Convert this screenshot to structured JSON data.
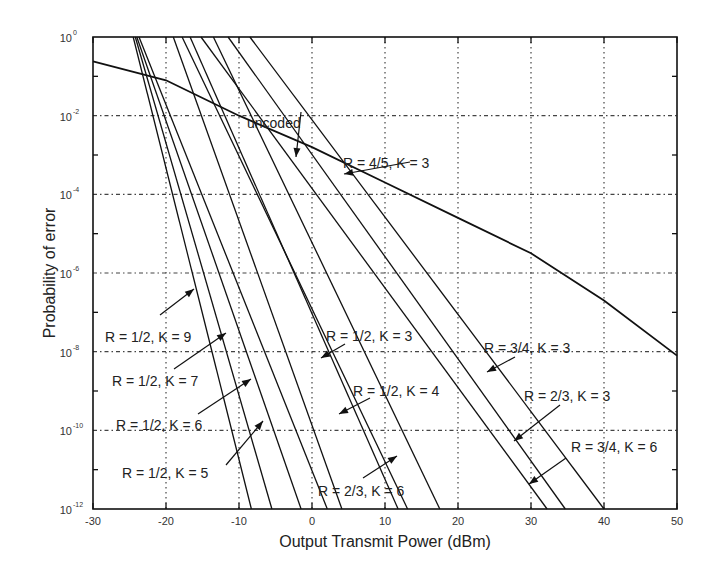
{
  "chart_data": {
    "type": "line",
    "title": "",
    "xlabel": "Output Transmit Power (dBm)",
    "ylabel": "Probability of error",
    "xlim": [
      -30,
      50
    ],
    "ylim_log10": [
      -12,
      0
    ],
    "yscale": "log",
    "grid": true,
    "x_ticks": [
      -30,
      -20,
      -10,
      0,
      10,
      20,
      30,
      40,
      50
    ],
    "y_ticks_exp": [
      0,
      -2,
      -4,
      -6,
      -8,
      -10,
      -12
    ],
    "series": [
      {
        "name": "uncoded",
        "points": [
          [
            -30,
            -0.62
          ],
          [
            -20,
            -1.1
          ],
          [
            -10,
            -2.0
          ],
          [
            0,
            -2.8
          ],
          [
            10,
            -3.7
          ],
          [
            20,
            -4.6
          ],
          [
            30,
            -5.5
          ],
          [
            40,
            -6.7
          ],
          [
            50,
            -8.1
          ]
        ]
      },
      {
        "name": "R = 1/2, K = 9",
        "points": [
          [
            -24.5,
            0
          ],
          [
            -8.3,
            -12
          ]
        ]
      },
      {
        "name": "R = 1/2, K = 7",
        "points": [
          [
            -24.2,
            0
          ],
          [
            -5.5,
            -12
          ]
        ]
      },
      {
        "name": "R = 1/2, K = 6",
        "points": [
          [
            -24.0,
            0
          ],
          [
            -1.5,
            -12
          ]
        ]
      },
      {
        "name": "R = 1/2, K = 5",
        "points": [
          [
            -23.7,
            0
          ],
          [
            2.1,
            -12
          ]
        ]
      },
      {
        "name": "R = 1/2, K = 4",
        "points": [
          [
            -19.0,
            0
          ],
          [
            4.1,
            -12
          ]
        ]
      },
      {
        "name": "R = 1/2, K = 3",
        "points": [
          [
            -17.8,
            0
          ],
          [
            13.1,
            -12
          ]
        ]
      },
      {
        "name": "R = 2/3, K = 6",
        "points": [
          [
            -16.7,
            0
          ],
          [
            11.8,
            -12
          ]
        ]
      },
      {
        "name": "R = 2/3, K = 3",
        "points": [
          [
            -15.2,
            0
          ],
          [
            32.2,
            -12
          ]
        ]
      },
      {
        "name": "R = 3/4, K = 6",
        "points": [
          [
            -13.5,
            0
          ],
          [
            17.5,
            -12
          ]
        ]
      },
      {
        "name": "R = 3/4, K = 3",
        "points": [
          [
            -11.5,
            0
          ],
          [
            34.7,
            -12
          ]
        ]
      },
      {
        "name": "R = 4/5, K = 3",
        "points": [
          [
            -8.5,
            0
          ],
          [
            40.0,
            -12
          ]
        ]
      }
    ],
    "annotations": [
      {
        "text": "uncoded",
        "x": 247,
        "y": 128
      },
      {
        "text": "R = 4/5, K = 3",
        "x": 343,
        "y": 168
      },
      {
        "text": "R = 1/2, K = 9",
        "x": 105,
        "y": 342
      },
      {
        "text": "R = 1/2, K = 7",
        "x": 112,
        "y": 386
      },
      {
        "text": "R = 1/2, K = 6",
        "x": 116,
        "y": 430
      },
      {
        "text": "R = 1/2, K = 5",
        "x": 122,
        "y": 478
      },
      {
        "text": "R = 1/2, K = 3",
        "x": 326,
        "y": 341
      },
      {
        "text": "R = 1/2, K = 4",
        "x": 353,
        "y": 396
      },
      {
        "text": "R = 2/3, K = 6",
        "x": 318,
        "y": 496
      },
      {
        "text": "R = 3/4, K = 3",
        "x": 484,
        "y": 353
      },
      {
        "text": "R = 2/3, K = 3",
        "x": 524,
        "y": 401
      },
      {
        "text": "R = 3/4, K = 6",
        "x": 571,
        "y": 452
      }
    ]
  },
  "labels": {
    "xlabel": "Output Transmit Power (dBm)",
    "ylabel": "Probability of error",
    "xticks": [
      "-30",
      "-20",
      "-10",
      "0",
      "10",
      "20",
      "30",
      "40",
      "50"
    ],
    "yticks_base": "10",
    "yticks_exp": [
      "0",
      "-2",
      "-4",
      "-6",
      "-8",
      "-10",
      "-12"
    ]
  }
}
